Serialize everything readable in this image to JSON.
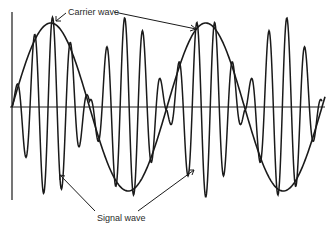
{
  "diagram": {
    "labels": {
      "carrier": "Carrier wave",
      "signal": "Signal wave"
    },
    "colors": {
      "stroke": "#1a1a1a",
      "background": "#ffffff",
      "text": "#2a2a2a"
    },
    "axes": {
      "y_axis_x": 12,
      "y_axis_top": 12,
      "y_axis_bottom": 200,
      "x_axis_y": 107,
      "x_axis_left": 10,
      "x_axis_right": 325
    },
    "carrier": {
      "description": "sinusoidal envelope",
      "x_start": 12,
      "x_end": 325,
      "amplitude_px": 84,
      "period_px": 155,
      "phase_px": 12
    },
    "signal": {
      "description": "high frequency oscillation modulated by carrier",
      "cycles_per_carrier_period": 8.6,
      "x_start": 12,
      "x_end": 322
    }
  }
}
